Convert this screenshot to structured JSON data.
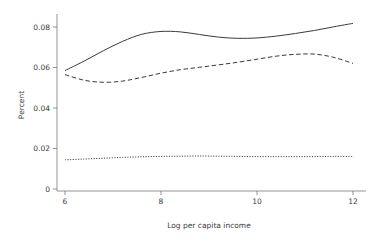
{
  "chart_data": {
    "type": "line",
    "title": "",
    "subtitle": "",
    "xlabel": "Log per capita income",
    "ylabel": "Percent",
    "xlim": [
      6,
      12
    ],
    "ylim": [
      0,
      0.088
    ],
    "grid": false,
    "legend": "none",
    "xticks": [
      6,
      8,
      10,
      12
    ],
    "xtick_labels": [
      "6",
      "8",
      "10",
      "12"
    ],
    "yticks": [
      0,
      0.02,
      0.04,
      0.06,
      0.08
    ],
    "ytick_labels": [
      "0",
      "0.02",
      "0.04",
      "0.06",
      "0.08"
    ],
    "x": [
      6.0,
      6.4,
      6.8,
      7.2,
      7.6,
      8.0,
      8.4,
      8.8,
      9.2,
      9.6,
      10.0,
      10.4,
      10.8,
      11.2,
      11.6,
      12.0
    ],
    "series": [
      {
        "name": "solid-curve",
        "style": "solid",
        "color": "#3a3a3a",
        "values": [
          0.0585,
          0.0632,
          0.0683,
          0.0729,
          0.0764,
          0.0778,
          0.0776,
          0.0763,
          0.075,
          0.0744,
          0.0746,
          0.0755,
          0.0768,
          0.0783,
          0.0801,
          0.0818
        ]
      },
      {
        "name": "dashed-curve",
        "style": "dashed",
        "color": "#3a3a3a",
        "values": [
          0.0565,
          0.0537,
          0.0527,
          0.0533,
          0.0551,
          0.0572,
          0.0589,
          0.0601,
          0.0613,
          0.0626,
          0.0641,
          0.0656,
          0.0665,
          0.0666,
          0.065,
          0.062
        ]
      },
      {
        "name": "dotted-curve",
        "style": "dotted",
        "color": "#3a3a3a",
        "values": [
          0.0144,
          0.0148,
          0.0152,
          0.0156,
          0.0159,
          0.0161,
          0.0162,
          0.0163,
          0.0162,
          0.0161,
          0.016,
          0.016,
          0.016,
          0.016,
          0.0161,
          0.0161
        ]
      }
    ]
  }
}
